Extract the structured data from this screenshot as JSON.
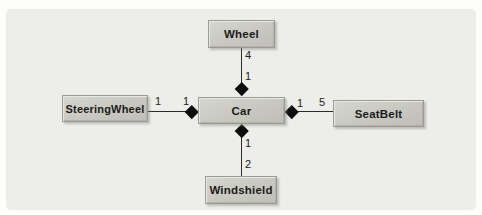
{
  "diagram": {
    "type": "uml-class-diagram",
    "notation": "composition",
    "nodes": {
      "wheel": {
        "label": "Wheel"
      },
      "steering_wheel": {
        "label": "SteeringWheel"
      },
      "car": {
        "label": "Car"
      },
      "seat_belt": {
        "label": "SeatBelt"
      },
      "windshield": {
        "label": "Windshield"
      }
    },
    "edges": {
      "car_wheel": {
        "type": "composition",
        "diamond_end": "car",
        "car_end": "1",
        "component_end": "4"
      },
      "car_steering_wheel": {
        "type": "composition",
        "diamond_end": "car",
        "car_end": "1",
        "component_end": "1"
      },
      "car_seat_belt": {
        "type": "composition",
        "diamond_end": "car",
        "car_end": "1",
        "component_end": "5"
      },
      "car_windshield": {
        "type": "composition",
        "diamond_end": "car",
        "car_end": "1",
        "component_end": "2"
      }
    },
    "colors": {
      "page_background": "#fdfdfb",
      "panel_background": "#ededea",
      "node_fill": "#c8c8c1",
      "node_highlight": "#e8e8e2",
      "node_border": "#9b9b93",
      "connector_line": "#2a2a2a",
      "diamond_fill": "#0d0d0d",
      "text": "#1b1b1b"
    }
  }
}
